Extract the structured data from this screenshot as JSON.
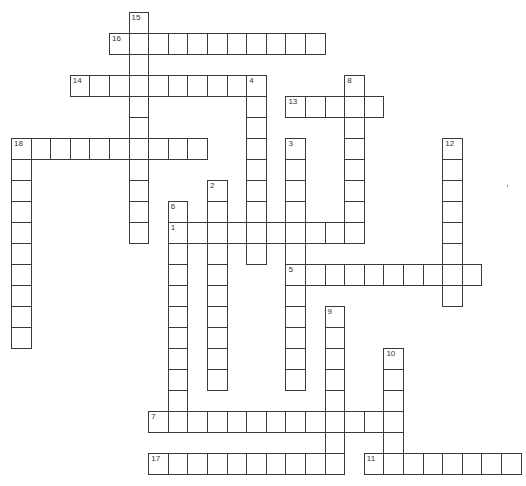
{
  "puzzle": {
    "type": "crossword",
    "grid": {
      "cols": 26,
      "rows": 22
    },
    "words": [
      {
        "number": 15,
        "direction": "down",
        "col": 6,
        "row": 0,
        "length": 11
      },
      {
        "number": 16,
        "direction": "across",
        "col": 5,
        "row": 1,
        "length": 11
      },
      {
        "number": 14,
        "direction": "across",
        "col": 3,
        "row": 3,
        "length": 10
      },
      {
        "number": 4,
        "direction": "down",
        "col": 12,
        "row": 3,
        "length": 9
      },
      {
        "number": 8,
        "direction": "down",
        "col": 17,
        "row": 3,
        "length": 8
      },
      {
        "number": 13,
        "direction": "across",
        "col": 14,
        "row": 4,
        "length": 5
      },
      {
        "number": 18,
        "direction": "across",
        "col": 0,
        "row": 6,
        "length": 10
      },
      {
        "number": 18,
        "direction": "down",
        "col": 0,
        "row": 6,
        "length": 10
      },
      {
        "number": 3,
        "direction": "down",
        "col": 14,
        "row": 6,
        "length": 12
      },
      {
        "number": 12,
        "direction": "down",
        "col": 22,
        "row": 6,
        "length": 8
      },
      {
        "number": 2,
        "direction": "down",
        "col": 10,
        "row": 8,
        "length": 10
      },
      {
        "number": 6,
        "direction": "down",
        "col": 8,
        "row": 9,
        "length": 11
      },
      {
        "number": 1,
        "direction": "across",
        "col": 8,
        "row": 10,
        "length": 10
      },
      {
        "number": 5,
        "direction": "across",
        "col": 14,
        "row": 12,
        "length": 10
      },
      {
        "number": 9,
        "direction": "down",
        "col": 16,
        "row": 14,
        "length": 8
      },
      {
        "number": 10,
        "direction": "down",
        "col": 19,
        "row": 16,
        "length": 6
      },
      {
        "number": 7,
        "direction": "across",
        "col": 7,
        "row": 19,
        "length": 13
      },
      {
        "number": 17,
        "direction": "across",
        "col": 7,
        "row": 21,
        "length": 10
      },
      {
        "number": 11,
        "direction": "across",
        "col": 18,
        "row": 21,
        "length": 8
      }
    ]
  },
  "colors": {
    "cell_border": "#3a3a3a",
    "cell_fill": "#ffffff",
    "number_text": "#333333"
  }
}
